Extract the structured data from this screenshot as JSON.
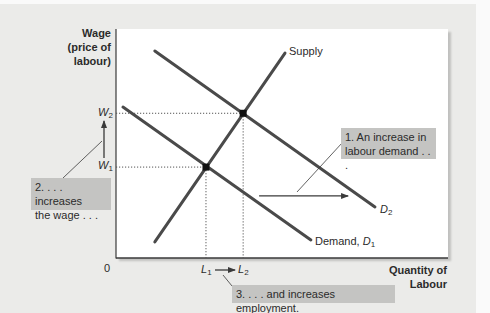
{
  "figure": {
    "y_axis_title": [
      "Wage",
      "(price of",
      "labour)"
    ],
    "x_axis_title": [
      "Quantity of",
      "Labour"
    ],
    "origin_label": "0",
    "ticks": {
      "w2": {
        "symbol": "W",
        "sub": "2"
      },
      "w1": {
        "symbol": "W",
        "sub": "1"
      },
      "l1": {
        "symbol": "L",
        "sub": "1"
      },
      "l2": {
        "symbol": "L",
        "sub": "2"
      }
    },
    "curve_labels": {
      "supply": "Supply",
      "d1_prefix": "Demand, ",
      "d1_symbol": "D",
      "d1_sub": "1",
      "d2_symbol": "D",
      "d2_sub": "2"
    },
    "callouts": {
      "one": [
        "1. An increase in",
        "labour demand . . ."
      ],
      "two": [
        "2. . . . increases",
        "the wage . . ."
      ],
      "three": "3. . . . and increases employment."
    },
    "colors": {
      "curve": "#4a4a4a",
      "dotted": "#555555",
      "arrow": "#3a3a3a",
      "callout_bg": "#c4c4c2",
      "panel_bg": "#ebebe9"
    }
  },
  "chart_data": {
    "type": "line",
    "title": "",
    "xlabel": "Quantity of Labour",
    "ylabel": "Wage (price of labour)",
    "xlim": [
      0,
      100
    ],
    "ylim": [
      0,
      100
    ],
    "grid": false,
    "legend": "none (curves labelled directly)",
    "series": [
      {
        "name": "Supply",
        "points": [
          [
            11.7,
            7.0
          ],
          [
            50.9,
            89.5
          ]
        ]
      },
      {
        "name": "Demand, D1",
        "points": [
          [
            2.1,
            65.9
          ],
          [
            58.7,
            7.9
          ]
        ]
      },
      {
        "name": "D2",
        "points": [
          [
            11.7,
            90.4
          ],
          [
            78.0,
            22.3
          ]
        ]
      }
    ],
    "equilibria": [
      {
        "name": "Initial (W1, L1)",
        "x": 27.1,
        "y": 39.7
      },
      {
        "name": "New (W2, L2)",
        "x": 38.3,
        "y": 63.2
      }
    ],
    "x_ticks": [
      {
        "label": "L1",
        "x": 27.1
      },
      {
        "label": "L2",
        "x": 38.3
      }
    ],
    "y_ticks": [
      {
        "label": "W1",
        "y": 39.7
      },
      {
        "label": "W2",
        "y": 63.2
      }
    ],
    "origin": "0",
    "shift_arrow": {
      "from": [
        43.1,
        27.1
      ],
      "to": [
        69.9,
        27.1
      ]
    },
    "annotations": [
      "1. An increase in labour demand . . .",
      "2. . . . increases the wage . . .",
      "3. . . . and increases employment."
    ]
  }
}
